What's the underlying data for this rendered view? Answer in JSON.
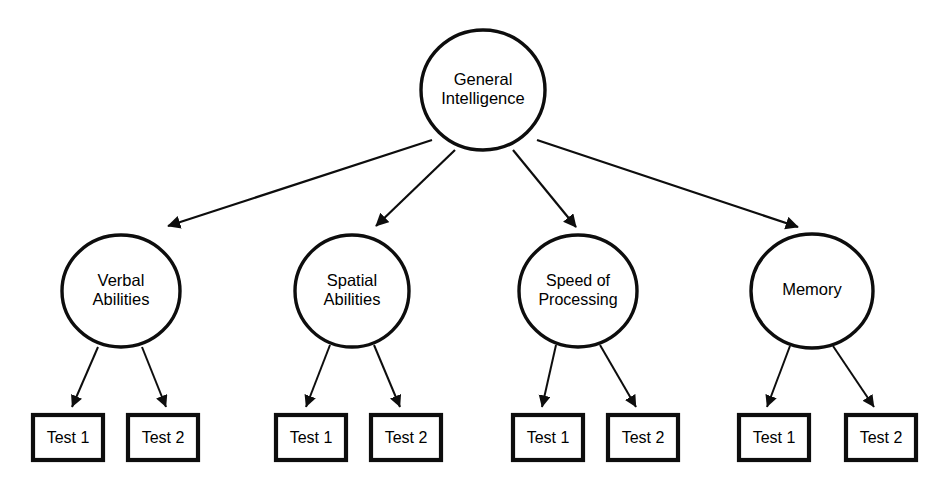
{
  "diagram": {
    "background_color": "#ffffff",
    "stroke_color": "#0d0d0d",
    "root": {
      "label_line1": "General",
      "label_line2": "Intelligence",
      "cx": 483,
      "cy": 90,
      "rx": 62,
      "ry": 60
    },
    "factors": [
      {
        "id": "verbal",
        "label_line1": "Verbal",
        "label_line2": "Abilities",
        "cx": 121,
        "cy": 291,
        "rx": 59,
        "ry": 56,
        "arrow_from_root": {
          "x1": 432,
          "y1": 140,
          "x2": 168,
          "y2": 226
        },
        "tests": [
          {
            "label": "Test 1",
            "box_x": 33,
            "box_y": 415,
            "box_w": 70,
            "box_h": 45,
            "arrow": {
              "x1": 98,
              "y1": 347,
              "x2": 72,
              "y2": 407
            }
          },
          {
            "label": "Test 2",
            "box_x": 128,
            "box_y": 415,
            "box_w": 70,
            "box_h": 45,
            "arrow": {
              "x1": 142,
              "y1": 347,
              "x2": 166,
              "y2": 407
            }
          }
        ]
      },
      {
        "id": "spatial",
        "label_line1": "Spatial",
        "label_line2": "Abilities",
        "cx": 352,
        "cy": 291,
        "rx": 57,
        "ry": 56,
        "arrow_from_root": {
          "x1": 455,
          "y1": 150,
          "x2": 376,
          "y2": 226
        },
        "tests": [
          {
            "label": "Test 1",
            "box_x": 276,
            "box_y": 415,
            "box_w": 70,
            "box_h": 45,
            "arrow": {
              "x1": 330,
              "y1": 345,
              "x2": 306,
              "y2": 407
            }
          },
          {
            "label": "Test 2",
            "box_x": 371,
            "box_y": 415,
            "box_w": 70,
            "box_h": 45,
            "arrow": {
              "x1": 374,
              "y1": 345,
              "x2": 400,
              "y2": 407
            }
          }
        ]
      },
      {
        "id": "speed",
        "label_line1": "Speed of",
        "label_line2": "Processing",
        "cx": 578,
        "cy": 291,
        "rx": 59,
        "ry": 56,
        "arrow_from_root": {
          "x1": 513,
          "y1": 150,
          "x2": 576,
          "y2": 227
        },
        "tests": [
          {
            "label": "Test 1",
            "box_x": 513,
            "box_y": 415,
            "box_w": 70,
            "box_h": 45,
            "arrow": {
              "x1": 556,
              "y1": 345,
              "x2": 542,
              "y2": 407
            }
          },
          {
            "label": "Test 2",
            "box_x": 608,
            "box_y": 415,
            "box_w": 70,
            "box_h": 45,
            "arrow": {
              "x1": 600,
              "y1": 345,
              "x2": 636,
              "y2": 407
            }
          }
        ]
      },
      {
        "id": "memory",
        "label_line1": "Memory",
        "label_line2": "",
        "cx": 812,
        "cy": 291,
        "rx": 61,
        "ry": 57,
        "arrow_from_root": {
          "x1": 537,
          "y1": 140,
          "x2": 798,
          "y2": 227
        },
        "tests": [
          {
            "label": "Test 1",
            "box_x": 739,
            "box_y": 415,
            "box_w": 70,
            "box_h": 45,
            "arrow": {
              "x1": 790,
              "y1": 346,
              "x2": 767,
              "y2": 407
            }
          },
          {
            "label": "Test 2",
            "box_x": 846,
            "box_y": 415,
            "box_w": 70,
            "box_h": 45,
            "arrow": {
              "x1": 833,
              "y1": 346,
              "x2": 874,
              "y2": 407
            }
          }
        ]
      }
    ]
  }
}
